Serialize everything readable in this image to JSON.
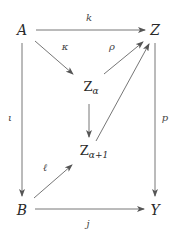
{
  "diagram": {
    "type": "commutative-diagram",
    "nodes": [
      {
        "id": "A",
        "label": "A",
        "x": 22,
        "y": 30
      },
      {
        "id": "Z",
        "label": "Z",
        "x": 155,
        "y": 30
      },
      {
        "id": "Za",
        "label": "Z",
        "sub": "α",
        "x": 89,
        "y": 89
      },
      {
        "id": "Za1",
        "label": "Z",
        "sub": "α+1",
        "x": 89,
        "y": 153
      },
      {
        "id": "B",
        "label": "B",
        "x": 22,
        "y": 210
      },
      {
        "id": "Y",
        "label": "Y",
        "x": 155,
        "y": 210
      }
    ],
    "edges": [
      {
        "from": "A",
        "to": "Z",
        "label": "k"
      },
      {
        "from": "A",
        "to": "Za",
        "label": "κ"
      },
      {
        "from": "Za",
        "to": "Z",
        "label": "ρ"
      },
      {
        "from": "Za",
        "to": "Za1",
        "label": ""
      },
      {
        "from": "Za1",
        "to": "Z",
        "label": ""
      },
      {
        "from": "A",
        "to": "B",
        "label": "ι"
      },
      {
        "from": "Z",
        "to": "Y",
        "label": "p"
      },
      {
        "from": "B",
        "to": "Za1",
        "label": "ℓ"
      },
      {
        "from": "B",
        "to": "Y",
        "label": "j"
      }
    ],
    "colors": {
      "line": "#555555",
      "text": "#2a2a2a"
    }
  }
}
